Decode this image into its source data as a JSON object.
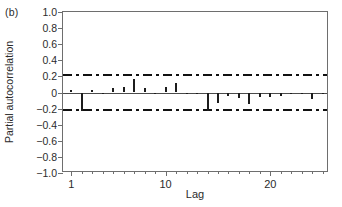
{
  "panel": {
    "label": "(b)"
  },
  "axes": {
    "ylabel": "Partial autocorrelation",
    "xlabel": "Lag"
  },
  "chart_data": {
    "type": "bar",
    "title": "",
    "subtitle": "",
    "panel_label": "(b)",
    "xlabel": "Lag",
    "ylabel": "Partial autocorrelation",
    "orientation": "vertical",
    "style": "stem-spike",
    "grid": false,
    "legend": null,
    "xlim": [
      0.2,
      25.6
    ],
    "ylim": [
      -1.0,
      1.0
    ],
    "ytick_values": [
      1.0,
      0.8,
      0.6,
      0.4,
      0.2,
      0,
      -0.2,
      -0.4,
      -0.6,
      -0.8,
      -1.0
    ],
    "ytick_labels": [
      "1.0",
      "0.8",
      "0.6",
      "0.4",
      "0.2",
      "0",
      "−0.2",
      "−0.4",
      "−0.6",
      "−0.8",
      "−1.0"
    ],
    "xtick_values": [
      1,
      2,
      3,
      4,
      5,
      6,
      7,
      8,
      9,
      10,
      11,
      12,
      13,
      14,
      15,
      16,
      17,
      18,
      19,
      20,
      21,
      22,
      23,
      24,
      25
    ],
    "xtick_major_values": [
      1,
      10,
      20
    ],
    "xtick_major_labels": [
      "1",
      "10",
      "20"
    ],
    "zero_line": 0,
    "confidence_bounds": {
      "upper": 0.215,
      "lower": -0.215,
      "style": "dash-dot",
      "color": "#111111",
      "label": ""
    },
    "categories": [
      1,
      2,
      3,
      4,
      5,
      6,
      7,
      8,
      9,
      10,
      11,
      12,
      13,
      14,
      15,
      16,
      17,
      18,
      19,
      20,
      21,
      22,
      23,
      24,
      25
    ],
    "values": [
      0.03,
      -0.23,
      0.03,
      -0.01,
      0.06,
      0.07,
      0.17,
      0.05,
      -0.01,
      0.07,
      0.12,
      0.0,
      -0.01,
      -0.23,
      -0.13,
      -0.04,
      -0.07,
      -0.14,
      -0.05,
      -0.06,
      -0.04,
      -0.02,
      -0.01,
      -0.08,
      0.0
    ],
    "colors": {
      "spike": "#1c1c1c",
      "axis": "#6e6e6e",
      "zero": "#4a4a4a",
      "bound": "#111111",
      "text": "#2b2b2b",
      "background": "#ffffff"
    }
  }
}
